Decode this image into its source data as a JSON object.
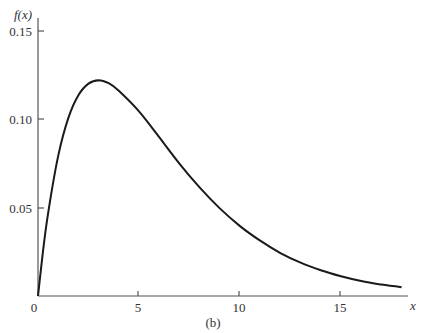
{
  "chart_data": {
    "type": "line",
    "title": "",
    "caption": "(b)",
    "xlabel": "x",
    "ylabel": "f(x)",
    "xlim": [
      0,
      18
    ],
    "ylim": [
      0,
      0.15
    ],
    "grid": false,
    "legend": null,
    "x_ticks": [
      "0",
      "5",
      "10",
      "15"
    ],
    "y_ticks": [
      "0.05",
      "0.10",
      "0.15"
    ],
    "series": [
      {
        "name": "f(x)",
        "x": [
          0,
          0.25,
          0.5,
          1,
          1.5,
          2,
          2.5,
          3,
          3.5,
          4,
          5,
          6,
          7,
          8,
          9,
          10,
          11,
          12,
          13,
          14,
          15,
          16,
          17,
          18
        ],
        "values": [
          0,
          0.0255,
          0.047,
          0.0796,
          0.1011,
          0.1141,
          0.1207,
          0.1226,
          0.1209,
          0.1166,
          0.1049,
          0.0902,
          0.0752,
          0.0617,
          0.0498,
          0.0397,
          0.0314,
          0.0244,
          0.0189,
          0.0146,
          0.0112,
          0.0085,
          0.0065,
          0.005
        ]
      }
    ]
  },
  "labels": {
    "ylabel": "f(x)",
    "xlabel": "x",
    "caption": "(b)",
    "x0": "0",
    "x5": "5",
    "x10": "10",
    "x15": "15",
    "y005": "0.05",
    "y010": "0.10",
    "y015": "0.15"
  }
}
